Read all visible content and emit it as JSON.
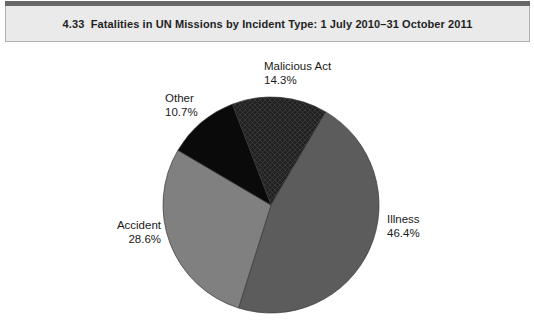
{
  "header": {
    "title": "4.33  Fatalities in UN Missions by Incident Type: 1 July 2010–31 October 2011",
    "top_bar_color": "#686868",
    "fill_color": "#eaeaea",
    "border_color": "#b0b0b0"
  },
  "chart_data": {
    "type": "pie",
    "title": "4.33  Fatalities in UN Missions by Incident Type: 1 July 2010–31 October 2011",
    "start_angle_deg": -21,
    "direction": "clockwise",
    "legend_position": "none",
    "labels_outside": true,
    "slice_stroke_color": "#3a3a3a",
    "slices": [
      {
        "label": "Malicious Act",
        "value": 14.3,
        "pct_label": "14.3%",
        "color": "#212121",
        "pattern": "crosshatch",
        "pattern_line_color": "#3a3a3a"
      },
      {
        "label": "Illness",
        "value": 46.4,
        "pct_label": "46.4%",
        "color": "#5c5c5c",
        "pattern": "solid"
      },
      {
        "label": "Accident",
        "value": 28.6,
        "pct_label": "28.6%",
        "color": "#808080",
        "pattern": "solid"
      },
      {
        "label": "Other",
        "value": 10.7,
        "pct_label": "10.7%",
        "color": "#0a0a0a",
        "pattern": "solid"
      }
    ]
  }
}
